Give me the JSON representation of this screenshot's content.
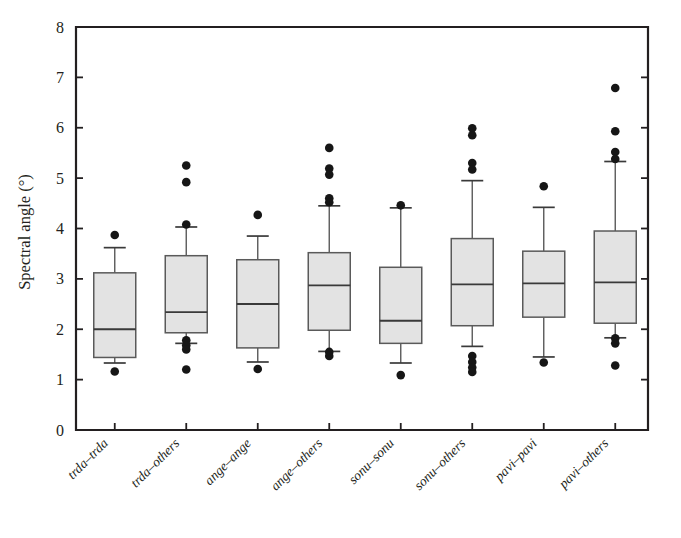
{
  "chart_data": {
    "type": "box",
    "title": "",
    "xlabel": "",
    "ylabel": "Spectral angle (°)",
    "ylim": [
      0,
      8
    ],
    "yticks": [
      0,
      1,
      2,
      3,
      4,
      5,
      6,
      7,
      8
    ],
    "ytick_labels": [
      "0",
      "1",
      "2",
      "3",
      "4",
      "5",
      "6",
      "7",
      "8"
    ],
    "grid": false,
    "legend": "none",
    "categories": [
      "trda–trda",
      "trda–others",
      "ange–ange",
      "ange–others",
      "sonu–sonu",
      "sonu–others",
      "pavi–pavi",
      "pavi–others"
    ],
    "boxes": [
      {
        "label": "trda–trda",
        "whisker_low": 1.33,
        "q1": 1.44,
        "median": 2.0,
        "q3": 3.12,
        "whisker_high": 3.62,
        "outliers": [
          3.87,
          1.16
        ]
      },
      {
        "label": "trda–others",
        "whisker_low": 1.72,
        "q1": 1.93,
        "median": 2.34,
        "q3": 3.46,
        "whisker_high": 4.03,
        "outliers": [
          5.25,
          4.92,
          4.08,
          1.78,
          1.68,
          1.6,
          1.2
        ]
      },
      {
        "label": "ange–ange",
        "whisker_low": 1.35,
        "q1": 1.63,
        "median": 2.5,
        "q3": 3.38,
        "whisker_high": 3.85,
        "outliers": [
          4.27,
          1.21
        ]
      },
      {
        "label": "ange–others",
        "whisker_low": 1.56,
        "q1": 1.98,
        "median": 2.87,
        "q3": 3.52,
        "whisker_high": 4.45,
        "outliers": [
          5.6,
          5.19,
          5.07,
          4.6,
          4.52,
          1.55,
          1.47
        ]
      },
      {
        "label": "sonu–sonu",
        "whisker_low": 1.33,
        "q1": 1.72,
        "median": 2.17,
        "q3": 3.23,
        "whisker_high": 4.41,
        "outliers": [
          4.46,
          1.09
        ]
      },
      {
        "label": "sonu–others",
        "whisker_low": 1.66,
        "q1": 2.07,
        "median": 2.89,
        "q3": 3.8,
        "whisker_high": 4.95,
        "outliers": [
          5.99,
          5.85,
          5.3,
          5.17,
          1.47,
          1.35,
          1.24,
          1.15
        ]
      },
      {
        "label": "pavi–pavi",
        "whisker_low": 1.45,
        "q1": 2.24,
        "median": 2.91,
        "q3": 3.55,
        "whisker_high": 4.42,
        "outliers": [
          4.84,
          1.34
        ]
      },
      {
        "label": "pavi–others",
        "whisker_low": 1.83,
        "q1": 2.12,
        "median": 2.93,
        "q3": 3.95,
        "whisker_high": 5.33,
        "outliers": [
          6.79,
          5.93,
          5.52,
          5.38,
          1.82,
          1.72,
          1.28
        ]
      }
    ],
    "style": {
      "box_fill": "#e3e3e3",
      "box_stroke": "#5a5a5a",
      "axis_color": "#231f20",
      "outlier_color": "#161616",
      "background": "#ffffff"
    }
  }
}
